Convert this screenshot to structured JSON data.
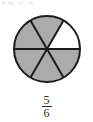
{
  "figure": {
    "name": "fraction-pie-diagram",
    "fraction": {
      "numerator": "5",
      "denominator": "6"
    }
  },
  "chart_data": {
    "type": "pie",
    "title": "",
    "subtitle": "",
    "xlabel": "",
    "ylabel": "",
    "legend": [],
    "total_slices": 6,
    "shaded_slices": 5,
    "unshaded_slices": 1,
    "slice_value": 1,
    "slice_angle_degrees": 60,
    "start_angle_degrees": 0,
    "categories": [
      "sector-1",
      "sector-2",
      "sector-3",
      "sector-4",
      "sector-5",
      "sector-6"
    ],
    "values": [
      1,
      1,
      1,
      1,
      1,
      1
    ],
    "slices": [
      {
        "label": "sector-1",
        "value": 1,
        "start_deg": 0,
        "end_deg": 60,
        "shaded": false,
        "fill": "#ffffff"
      },
      {
        "label": "sector-2",
        "value": 1,
        "start_deg": 60,
        "end_deg": 120,
        "shaded": true,
        "fill": "#ababab"
      },
      {
        "label": "sector-3",
        "value": 1,
        "start_deg": 120,
        "end_deg": 180,
        "shaded": true,
        "fill": "#ababab"
      },
      {
        "label": "sector-4",
        "value": 1,
        "start_deg": 180,
        "end_deg": 240,
        "shaded": true,
        "fill": "#ababab"
      },
      {
        "label": "sector-5",
        "value": 1,
        "start_deg": 240,
        "end_deg": 300,
        "shaded": true,
        "fill": "#ababab"
      },
      {
        "label": "sector-6",
        "value": 1,
        "start_deg": 300,
        "end_deg": 360,
        "shaded": true,
        "fill": "#ababab"
      }
    ],
    "annotations": [
      "5/6"
    ],
    "grid": false,
    "legend_position": "none"
  },
  "colors": {
    "shaded_fill": "#ababab",
    "unshaded_fill": "#ffffff",
    "outline": "#1c1c1c",
    "divider": "#1c1c1c",
    "text": "#2a2a2a",
    "background": "#ffffff"
  },
  "geometry": {
    "center_x": 47,
    "center_y": 49,
    "radius": 33
  }
}
